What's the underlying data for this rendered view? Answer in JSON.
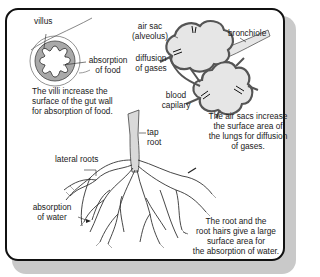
{
  "panels": {
    "villus": {
      "labels": {
        "villus": "villus",
        "absorption_1": "absorption",
        "absorption_2": "of food"
      },
      "caption": [
        "The villi increase the",
        "surface of the gut wall",
        "for absorption of food."
      ]
    },
    "lungs": {
      "labels": {
        "air_sac_1": "air sac",
        "air_sac_2": "(alveolus)",
        "bronchiole": "bronchiole",
        "diffusion_1": "diffusion",
        "diffusion_2": "of gases",
        "blood_1": "blood",
        "blood_2": "capilary"
      },
      "caption": [
        "The air sacs increase",
        "the surface area of",
        "the lungs for diffusion",
        "of gases."
      ]
    },
    "root": {
      "labels": {
        "tap_1": "tap",
        "tap_2": "root",
        "lateral": "lateral roots",
        "absorption_1": "absorption",
        "absorption_2": "of water"
      },
      "caption": [
        "The root and the",
        "root hairs give a large",
        "surface area for",
        "the absorption of water."
      ]
    }
  },
  "colors": {
    "frame": "#111111",
    "shadow": "#c9c9c9",
    "villus_fill": "#a9a9a9",
    "alveolus_fill": "#e6e6e6",
    "capillary": "#555555",
    "root_fill": "#d9d9d9"
  }
}
